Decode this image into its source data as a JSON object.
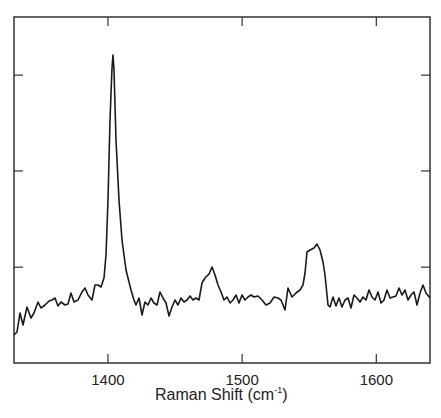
{
  "chart_data": {
    "type": "line",
    "title": "",
    "xlabel": "Raman Shift (cm-1)",
    "xlabel_parts": {
      "main": "Raman Shift (cm",
      "sup": "-1",
      "end": ")"
    },
    "ylabel": "",
    "xlim": [
      1330,
      1640
    ],
    "ylim": [
      0,
      100
    ],
    "x_ticks": [
      1400,
      1500,
      1600
    ],
    "x_tick_labels": [
      "1400",
      "1500",
      "1600"
    ],
    "y_ticks_unlabeled": [
      27.7,
      55.5,
      83.2
    ],
    "grid": false,
    "legend": null,
    "line_color": "#1a1a1a",
    "series": [
      {
        "name": "Raman spectrum",
        "points_px": [
          [
            14,
            335
          ],
          [
            17,
            332
          ],
          [
            20,
            313
          ],
          [
            23,
            325
          ],
          [
            27,
            307
          ],
          [
            31,
            318
          ],
          [
            34,
            313
          ],
          [
            38,
            302
          ],
          [
            41,
            308
          ],
          [
            45,
            305
          ],
          [
            49,
            301
          ],
          [
            52,
            300
          ],
          [
            55,
            298
          ],
          [
            58,
            306
          ],
          [
            61,
            302
          ],
          [
            65,
            305
          ],
          [
            68,
            304
          ],
          [
            71,
            293
          ],
          [
            74,
            302
          ],
          [
            78,
            300
          ],
          [
            82,
            292
          ],
          [
            85,
            288
          ],
          [
            88,
            295
          ],
          [
            92,
            300
          ],
          [
            95,
            285
          ],
          [
            98,
            285
          ],
          [
            101,
            287
          ],
          [
            104,
            278
          ],
          [
            106,
            255
          ],
          [
            108,
            200
          ],
          [
            110,
            120
          ],
          [
            112,
            68
          ],
          [
            113,
            55
          ],
          [
            114,
            70
          ],
          [
            116,
            140
          ],
          [
            119,
            200
          ],
          [
            122,
            240
          ],
          [
            126,
            270
          ],
          [
            128,
            278
          ],
          [
            131,
            290
          ],
          [
            134,
            300
          ],
          [
            136,
            305
          ],
          [
            139,
            298
          ],
          [
            142,
            315
          ],
          [
            145,
            302
          ],
          [
            148,
            305
          ],
          [
            151,
            298
          ],
          [
            154,
            303
          ],
          [
            157,
            305
          ],
          [
            160,
            292
          ],
          [
            163,
            298
          ],
          [
            166,
            303
          ],
          [
            169,
            316
          ],
          [
            172,
            307
          ],
          [
            175,
            300
          ],
          [
            178,
            305
          ],
          [
            181,
            298
          ],
          [
            184,
            302
          ],
          [
            187,
            300
          ],
          [
            190,
            296
          ],
          [
            193,
            300
          ],
          [
            196,
            298
          ],
          [
            199,
            300
          ],
          [
            202,
            283
          ],
          [
            205,
            278
          ],
          [
            209,
            274
          ],
          [
            212,
            267
          ],
          [
            215,
            275
          ],
          [
            218,
            285
          ],
          [
            221,
            292
          ],
          [
            224,
            300
          ],
          [
            227,
            297
          ],
          [
            230,
            303
          ],
          [
            233,
            300
          ],
          [
            236,
            295
          ],
          [
            239,
            303
          ],
          [
            242,
            295
          ],
          [
            245,
            300
          ],
          [
            248,
            297
          ],
          [
            251,
            295
          ],
          [
            254,
            297
          ],
          [
            258,
            296
          ],
          [
            262,
            300
          ],
          [
            266,
            305
          ],
          [
            270,
            303
          ],
          [
            274,
            297
          ],
          [
            278,
            298
          ],
          [
            281,
            300
          ],
          [
            285,
            310
          ],
          [
            288,
            288
          ],
          [
            292,
            297
          ],
          [
            296,
            293
          ],
          [
            300,
            290
          ],
          [
            303,
            285
          ],
          [
            305,
            273
          ],
          [
            307,
            252
          ],
          [
            310,
            250
          ],
          [
            314,
            248
          ],
          [
            317,
            244
          ],
          [
            320,
            250
          ],
          [
            323,
            262
          ],
          [
            325,
            275
          ],
          [
            328,
            305
          ],
          [
            330,
            307
          ],
          [
            333,
            297
          ],
          [
            336,
            306
          ],
          [
            339,
            298
          ],
          [
            342,
            307
          ],
          [
            345,
            300
          ],
          [
            348,
            298
          ],
          [
            351,
            308
          ],
          [
            354,
            295
          ],
          [
            357,
            298
          ],
          [
            360,
            302
          ],
          [
            363,
            297
          ],
          [
            366,
            300
          ],
          [
            369,
            290
          ],
          [
            372,
            297
          ],
          [
            375,
            300
          ],
          [
            378,
            292
          ],
          [
            381,
            303
          ],
          [
            384,
            300
          ],
          [
            387,
            290
          ],
          [
            390,
            298
          ],
          [
            393,
            297
          ],
          [
            396,
            296
          ],
          [
            399,
            288
          ],
          [
            402,
            295
          ],
          [
            405,
            290
          ],
          [
            408,
            300
          ],
          [
            411,
            295
          ],
          [
            414,
            292
          ],
          [
            417,
            305
          ],
          [
            420,
            293
          ],
          [
            423,
            285
          ],
          [
            426,
            293
          ],
          [
            430,
            298
          ]
        ],
        "peaks": [
          {
            "x": 1402,
            "y": 89.3,
            "label": "main peak"
          },
          {
            "x": 1477,
            "y": 27.7
          },
          {
            "x": 1548,
            "y": 34.4
          }
        ]
      }
    ],
    "frame_px": {
      "left": 14,
      "top": 17,
      "right": 430,
      "bottom": 363
    }
  }
}
